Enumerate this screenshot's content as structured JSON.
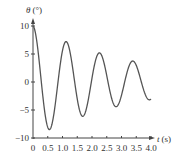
{
  "chart_data": {
    "type": "line",
    "title": "",
    "xlabel": "t (s)",
    "ylabel": "θ (°)",
    "xlabel_var": "t",
    "xlabel_unit": "(s)",
    "ylabel_var": "θ",
    "ylabel_unit": "(°)",
    "xlim": [
      0,
      4.0
    ],
    "ylim": [
      -10,
      10
    ],
    "xticks": [
      "0",
      "0.5",
      "1.0",
      "1.5",
      "2.0",
      "2.5",
      "3.0",
      "3.5",
      "4.0"
    ],
    "yticks": [
      "10",
      "5",
      "0",
      "−5",
      "−10"
    ],
    "grid": false,
    "series": [
      {
        "name": "θ(t) damped oscillation",
        "model": "θ = 10·e^(−0.29t)·cos(5.56t)",
        "amplitude": 10,
        "damping": 0.29,
        "omega": 5.56,
        "extrema": [
          {
            "t": 0.0,
            "theta": 10
          },
          {
            "t": 0.56,
            "theta": -9.0
          },
          {
            "t": 1.12,
            "theta": 7.3
          },
          {
            "t": 1.69,
            "theta": -6.8
          },
          {
            "t": 2.24,
            "theta": 5.0
          },
          {
            "t": 2.82,
            "theta": -5.2
          },
          {
            "t": 3.39,
            "theta": 3.9
          },
          {
            "t": 4.0,
            "theta": -3.9
          }
        ]
      }
    ]
  },
  "colors": {
    "curve": "#555555",
    "axis": "#444444",
    "text": "#333333"
  }
}
